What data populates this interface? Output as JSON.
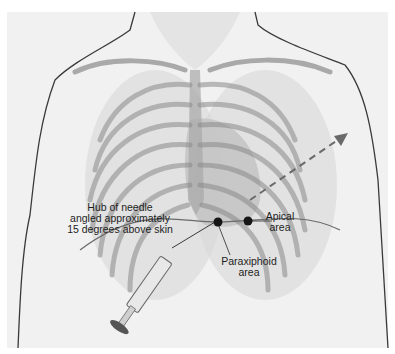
{
  "figure": {
    "type": "medical-illustration",
    "labels": {
      "needle_hub_line1": "Hub of needle",
      "needle_hub_line2": "angled approximately",
      "needle_hub_line3": "15 degrees above skin",
      "apical_line1": "Apical",
      "apical_line2": "area",
      "paraxiphoid_line1": "Paraxiphoid",
      "paraxiphoid_line2": "area"
    },
    "markers": [
      {
        "name": "paraxiphoid-site",
        "x": 218,
        "y": 222
      },
      {
        "name": "apical-site",
        "x": 248,
        "y": 221
      }
    ],
    "colors": {
      "background": "#f1f1f1",
      "outline": "#3a3a3a",
      "ribs": "#8a8a8a",
      "marker": "#151515",
      "text": "#1e1e1e"
    }
  }
}
